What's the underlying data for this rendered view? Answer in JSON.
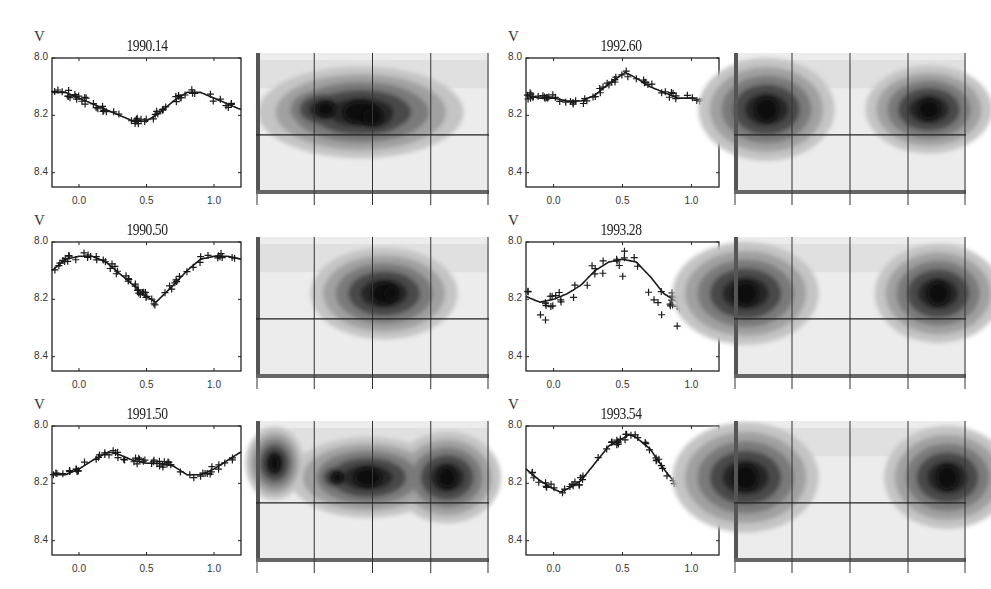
{
  "header": {
    "right_text_fragment": ""
  },
  "axis": {
    "y_label": "V",
    "y_ticks": [
      "8.0",
      "8.2",
      "8.4"
    ],
    "x_ticks": [
      "0.0",
      "0.5",
      "1.0"
    ]
  },
  "panels": [
    {
      "epoch": "1990.14"
    },
    {
      "epoch": "1990.50"
    },
    {
      "epoch": "1991.50"
    },
    {
      "epoch": "1992.60"
    },
    {
      "epoch": "1993.28"
    },
    {
      "epoch": "1993.54"
    }
  ],
  "colors": {
    "ink": "#222222",
    "map_light": "#e6e6e6",
    "map_mid": "#9a9a9a",
    "map_dark": "#3a3a3a",
    "map_core": "#111111"
  },
  "chart_data": [
    {
      "type": "scatter",
      "title": "1990.14",
      "xlabel": "phase",
      "ylabel": "V",
      "xlim": [
        -0.2,
        1.2
      ],
      "ylim": [
        8.45,
        8.0
      ],
      "y_inverted": true,
      "x_ticks": [
        0.0,
        0.5,
        1.0
      ],
      "y_ticks": [
        8.0,
        8.2,
        8.4
      ],
      "fit_curve": {
        "x": [
          -0.2,
          -0.1,
          0.0,
          0.1,
          0.2,
          0.3,
          0.4,
          0.5,
          0.6,
          0.7,
          0.8,
          0.9,
          1.0,
          1.1,
          1.2
        ],
        "y": [
          8.12,
          8.12,
          8.14,
          8.16,
          8.18,
          8.2,
          8.22,
          8.22,
          8.19,
          8.15,
          8.12,
          8.12,
          8.14,
          8.16,
          8.18
        ]
      },
      "points_description": "~80 observations scattered around the fit, minimum near phase 0.45 at V≈8.23, maximum near phase 0.85 at V≈8.12"
    },
    {
      "type": "scatter",
      "title": "1990.50",
      "xlabel": "phase",
      "ylabel": "V",
      "xlim": [
        -0.2,
        1.2
      ],
      "ylim": [
        8.45,
        8.0
      ],
      "y_inverted": true,
      "fit_curve": {
        "x": [
          -0.2,
          -0.1,
          0.0,
          0.1,
          0.2,
          0.3,
          0.4,
          0.5,
          0.57,
          0.7,
          0.8,
          0.9,
          1.0,
          1.1,
          1.2
        ],
        "y": [
          8.1,
          8.06,
          8.05,
          8.05,
          8.07,
          8.11,
          8.15,
          8.19,
          8.21,
          8.15,
          8.1,
          8.06,
          8.05,
          8.05,
          8.06
        ]
      },
      "points_description": "minimum near phase 0.57 at V≈8.21, maximum near phase 0.05 at V≈8.05"
    },
    {
      "type": "scatter",
      "title": "1991.50",
      "xlabel": "phase",
      "ylabel": "V",
      "xlim": [
        -0.2,
        1.2
      ],
      "ylim": [
        8.45,
        8.0
      ],
      "y_inverted": true,
      "fit_curve": {
        "x": [
          -0.2,
          -0.1,
          0.0,
          0.1,
          0.22,
          0.3,
          0.4,
          0.5,
          0.6,
          0.7,
          0.8,
          0.9,
          1.0,
          1.1,
          1.2
        ],
        "y": [
          8.17,
          8.17,
          8.15,
          8.12,
          8.09,
          8.1,
          8.12,
          8.13,
          8.13,
          8.14,
          8.17,
          8.17,
          8.15,
          8.12,
          8.09
        ]
      },
      "points_description": "shallow double-wave, maximum near phase 0.22 at V≈8.09, minima near 0.85 and -0.15 at V≈8.17"
    },
    {
      "type": "scatter",
      "title": "1992.60",
      "xlabel": "phase",
      "ylabel": "V",
      "xlim": [
        -0.2,
        1.2
      ],
      "ylim": [
        8.45,
        8.0
      ],
      "y_inverted": true,
      "fit_curve": {
        "x": [
          -0.2,
          -0.1,
          0.0,
          0.1,
          0.2,
          0.3,
          0.4,
          0.52,
          0.6,
          0.7,
          0.8,
          0.9,
          1.0,
          1.1,
          1.2
        ],
        "y": [
          8.13,
          8.14,
          8.14,
          8.15,
          8.15,
          8.13,
          8.09,
          8.05,
          8.07,
          8.1,
          8.12,
          8.14,
          8.14,
          8.15,
          8.15
        ]
      },
      "points_description": "single peak near phase 0.52 at V≈8.05, flat at V≈8.14 elsewhere"
    },
    {
      "type": "scatter",
      "title": "1993.28",
      "xlabel": "phase",
      "ylabel": "V",
      "xlim": [
        -0.2,
        1.2
      ],
      "ylim": [
        8.45,
        8.0
      ],
      "y_inverted": true,
      "fit_curve": {
        "x": [
          -0.2,
          -0.1,
          0.0,
          0.1,
          0.2,
          0.3,
          0.4,
          0.5,
          0.6,
          0.7,
          0.8,
          0.9,
          1.0,
          1.1,
          1.2
        ],
        "y": [
          8.19,
          8.21,
          8.2,
          8.18,
          8.15,
          8.1,
          8.07,
          8.06,
          8.07,
          8.12,
          8.18,
          8.21,
          8.2,
          8.18,
          8.16
        ]
      },
      "points_description": "maximum near phase 0.5 at V≈8.06, minima near -0.1 and 0.9 at V≈8.21; scatter extends to V≈8.26"
    },
    {
      "type": "scatter",
      "title": "1993.54",
      "xlabel": "phase",
      "ylabel": "V",
      "xlim": [
        -0.2,
        1.2
      ],
      "ylim": [
        8.45,
        8.0
      ],
      "y_inverted": true,
      "fit_curve": {
        "x": [
          -0.2,
          -0.1,
          0.0,
          0.05,
          0.1,
          0.2,
          0.3,
          0.4,
          0.55,
          0.6,
          0.7,
          0.8,
          0.9,
          1.0,
          1.1,
          1.2
        ],
        "y": [
          8.15,
          8.19,
          8.22,
          8.23,
          8.22,
          8.19,
          8.13,
          8.07,
          8.03,
          8.04,
          8.08,
          8.15,
          8.21,
          8.23,
          8.22,
          8.2
        ]
      },
      "points_description": "large amplitude, maximum near phase 0.55 at V≈8.03, minimum near phase 0.05/1.05 at V≈8.23"
    },
    {
      "type": "heatmap",
      "title": "Doppler/spot map panels (6)",
      "description": "Grey-scale surface maps paired with each light curve; 4 vertical grid lines and one horizontal line at ~58% height. Dark spot regions: 1990.14 central-left elongated; 1990.50 centered; 1991.50 central and right; 1992.60, 1993.28, 1993.54 two spots at left and right edges.",
      "colorscale": [
        "#f2f2f2",
        "#c8c8c8",
        "#9a9a9a",
        "#5a5a5a",
        "#2a2a2a",
        "#0a0a0a"
      ]
    }
  ]
}
